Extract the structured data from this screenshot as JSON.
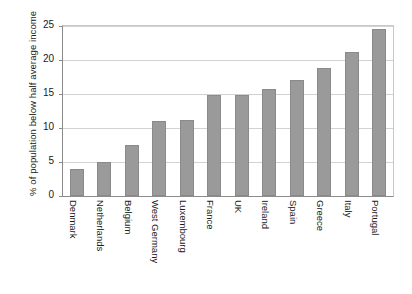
{
  "chart_data": {
    "type": "bar",
    "title": "",
    "xlabel": "",
    "ylabel": "% of population below half average income",
    "ylim": [
      0,
      25
    ],
    "yticks": [
      0,
      5,
      10,
      15,
      20,
      25
    ],
    "ytick_labels": [
      "0",
      "5",
      "10",
      "15",
      "20",
      "25"
    ],
    "grid": true,
    "legend": false,
    "bar_color": "#9a9a9a",
    "bar_edge_color": "#8a8a8a",
    "gridline_color": "#d2d2d2",
    "axis_color": "#8c8c8c",
    "background_color": "#ffffff",
    "categories": [
      "Denmark",
      "Netherlands",
      "Belgium",
      "West Germany",
      "Luxembourg",
      "France",
      "UK",
      "Ireland",
      "Spain",
      "Greece",
      "Italy",
      "Portugal"
    ],
    "values": [
      4.0,
      5.0,
      7.5,
      11.0,
      11.2,
      14.9,
      14.9,
      15.8,
      17.0,
      18.8,
      21.2,
      24.6
    ]
  }
}
